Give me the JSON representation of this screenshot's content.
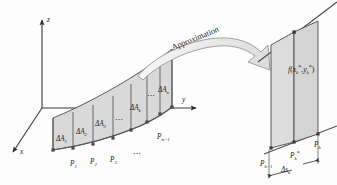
{
  "figure": {
    "name": "surface-area-approximation-diagram",
    "caption_visible": false,
    "background_color": "#fdfdfd",
    "fill_color": "#d9d9d9",
    "stroke_color": "#3a3a3a",
    "arrow_fill": "#eeeeee"
  },
  "axes": {
    "z_label": "z",
    "y_label": "y",
    "x_label": "x",
    "origin_note": ""
  },
  "annotation": {
    "approximation_label": "Approximation"
  },
  "left_panel": {
    "area_labels": [
      {
        "base": "ΔA",
        "sub": "1"
      },
      {
        "base": "ΔA",
        "sub": "2"
      },
      {
        "base": "ΔA",
        "sub": "3"
      },
      {
        "base": "ΔA",
        "sub": "k"
      },
      {
        "base": "ΔA",
        "sub": "n"
      }
    ],
    "point_labels": [
      {
        "base": "P",
        "sub": "1"
      },
      {
        "base": "P",
        "sub": "2"
      },
      {
        "base": "P",
        "sub": "3"
      },
      {
        "base": "P",
        "sub": "n−1"
      }
    ],
    "ellipsis": "⋯"
  },
  "right_panel": {
    "function_label": {
      "f": "f",
      "open": "(",
      "x": "x",
      "x_sub": "k",
      "star1": "*",
      "comma": ",",
      "y": "y",
      "y_sub": "k",
      "star2": "*",
      "close": ")"
    },
    "point_labels": [
      {
        "base": "P",
        "sub": "k−1",
        "star": ""
      },
      {
        "base": "P",
        "sub": "k",
        "star": "*"
      },
      {
        "base": "P",
        "sub": "k",
        "star": ""
      }
    ],
    "width_label": {
      "base": "Δs",
      "sub": "k"
    }
  }
}
